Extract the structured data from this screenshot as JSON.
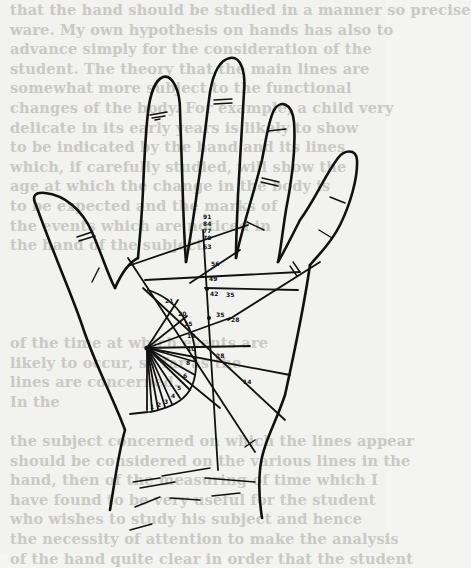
{
  "page": {
    "type": "scanned-book-page",
    "figure": "hand-diagram-palm-age-markings"
  },
  "bleed_through_text": [
    "that the hand should be studied in a manner so precise",
    "ware. My own hypothesis on hands has also to",
    "advance simply for the consideration of the",
    "student. The theory that the main lines are",
    "somewhat more subject to the functional",
    "changes of the body. For example, a child very",
    "delicate in its early years is likely to show",
    "to be indicated by the hand and its lines",
    "which, if carefully studied, will show the",
    "age at which the change in the body is",
    "to be expected and the marks of",
    "the events which are noticed in",
    "the hand of the subject.",
    "",
    "",
    "",
    "",
    "of the time at which events are",
    "likely to occur, so far as the",
    "lines are concerned.",
    "In the",
    "",
    "the subject concerned on which the lines appear",
    "should be considered on the various lines in the",
    "hand, then of the measuring of time which I",
    "have found to be very useful for the student",
    "who wishes to study his subject and hence",
    "the necessity of attention to make the analysis",
    "of the hand quite clear in order that the student"
  ],
  "diagram": {
    "vertical_line_labels": [
      "91",
      "84",
      "77",
      "70",
      "63",
      "56",
      "49",
      "42",
      "35",
      "28"
    ],
    "arc_labels": [
      "21",
      "20",
      "15",
      "12",
      "10",
      "8",
      "6",
      "5",
      "4",
      "3",
      "2",
      "1"
    ],
    "right_labels": [
      "35",
      "28",
      "14"
    ],
    "colors": {
      "ink": "#111111",
      "paper": "#f2f2f0",
      "bleed_text": "#c9c9c6"
    }
  }
}
